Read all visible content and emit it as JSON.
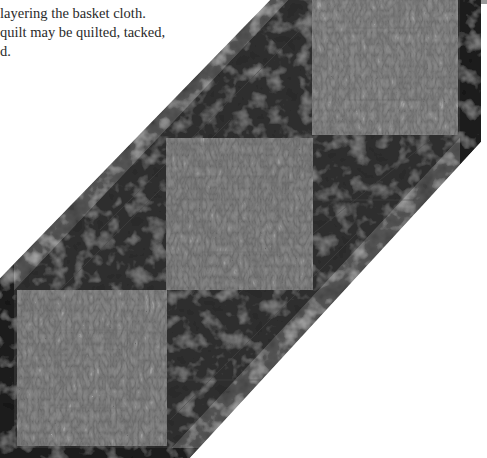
{
  "page": {
    "text_lines": [
      "p g",
      "layering the basket cloth.",
      "quilt may be quilted, tacked,",
      "d."
    ]
  },
  "figure": {
    "colors": {
      "background": "#ffffff",
      "border": "#1c1c1c",
      "dark_block": "#2e2e2e",
      "light_block": "#8a8a8a",
      "text": "#2a2a2a",
      "page_tab": "#9a9a9a"
    },
    "blocks": [
      {
        "name": "upper-light-block",
        "x": 312,
        "y": 0,
        "w": 146,
        "h": 135
      },
      {
        "name": "middle-light-block",
        "x": 166,
        "y": 138,
        "w": 147,
        "h": 152
      },
      {
        "name": "lower-light-block",
        "x": 17,
        "y": 290,
        "w": 150,
        "h": 156
      }
    ]
  }
}
